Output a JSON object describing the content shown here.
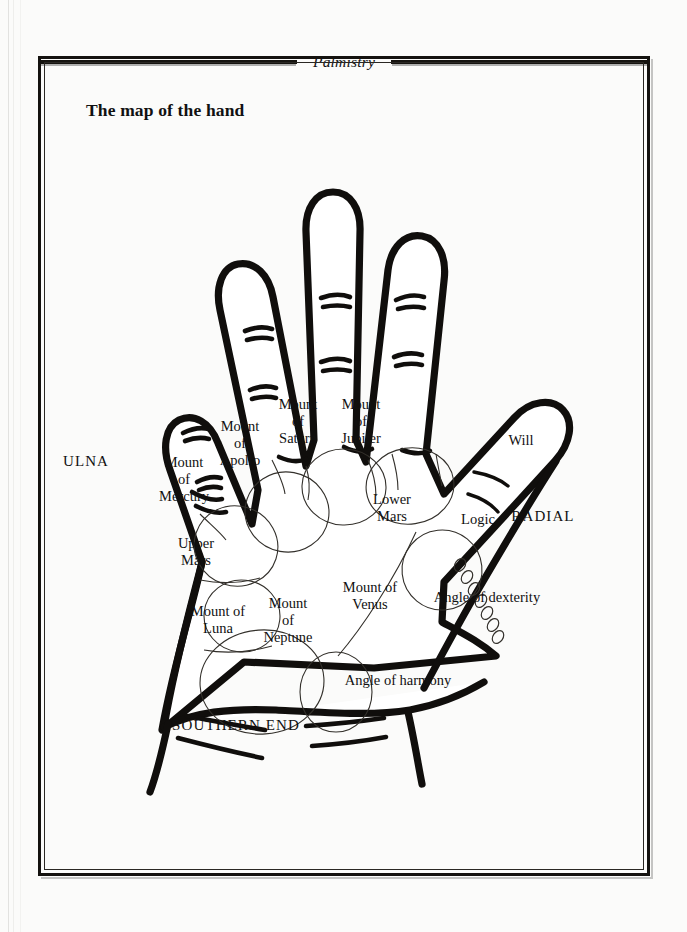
{
  "page": {
    "running_head": "Palmistry",
    "figure_title": "The map of the hand",
    "background_color": "#fbfbfa",
    "ink_color": "#100e0c"
  },
  "diagram": {
    "type": "palmistry-hand-map",
    "hand": "left palm, fingers spread, thumb to the right",
    "labels": [
      {
        "id": "ulna",
        "text": "ULNA",
        "style": "caps",
        "x": 86,
        "y": 461
      },
      {
        "id": "radial",
        "text": "RADIAL",
        "style": "caps",
        "x": 543,
        "y": 516
      },
      {
        "id": "southern-end",
        "text": "SOUTHERN END",
        "style": "caps",
        "x": 236,
        "y": 725
      },
      {
        "id": "mount-of-mercury",
        "text": "Mount\nof\nMercury",
        "style": "normal",
        "x": 184,
        "y": 479
      },
      {
        "id": "mount-of-apollo",
        "text": "Mount\nof\nApollo",
        "style": "normal",
        "x": 240,
        "y": 443
      },
      {
        "id": "mount-of-saturn",
        "text": "Mount\nof\nSaturn",
        "style": "normal",
        "x": 298,
        "y": 421
      },
      {
        "id": "mount-of-jupiter",
        "text": "Mount\nof\nJupiter",
        "style": "normal",
        "x": 361,
        "y": 421
      },
      {
        "id": "upper-mars",
        "text": "Upper\nMars",
        "style": "normal",
        "x": 196,
        "y": 552
      },
      {
        "id": "lower-mars",
        "text": "Lower\nMars",
        "style": "normal",
        "x": 392,
        "y": 508
      },
      {
        "id": "mount-of-luna",
        "text": "Mount of\nLuna",
        "style": "normal",
        "x": 218,
        "y": 620
      },
      {
        "id": "mount-of-neptune",
        "text": "Mount\nof\nNeptune",
        "style": "normal",
        "x": 288,
        "y": 620
      },
      {
        "id": "mount-of-venus",
        "text": "Mount of\nVenus",
        "style": "normal",
        "x": 370,
        "y": 596
      },
      {
        "id": "will",
        "text": "Will",
        "style": "normal",
        "x": 521,
        "y": 440
      },
      {
        "id": "logic",
        "text": "Logic",
        "style": "normal",
        "x": 478,
        "y": 519
      },
      {
        "id": "angle-dexterity",
        "text": "Angle of dexterity",
        "style": "normal",
        "x": 487,
        "y": 597
      },
      {
        "id": "angle-harmony",
        "text": "Angle of harmony",
        "style": "normal",
        "x": 398,
        "y": 680
      }
    ],
    "mounts": [
      "Mount of Mercury",
      "Mount of Apollo",
      "Mount of Saturn",
      "Mount of Jupiter",
      "Upper Mars",
      "Lower Mars",
      "Mount of Luna",
      "Mount of Neptune",
      "Mount of Venus"
    ],
    "thumb_phalanges": [
      "Will",
      "Logic"
    ],
    "anatomical_sides": [
      "ULNA",
      "RADIAL"
    ],
    "angles": [
      "Angle of dexterity",
      "Angle of harmony"
    ],
    "wrist_label": "SOUTHERN END"
  }
}
